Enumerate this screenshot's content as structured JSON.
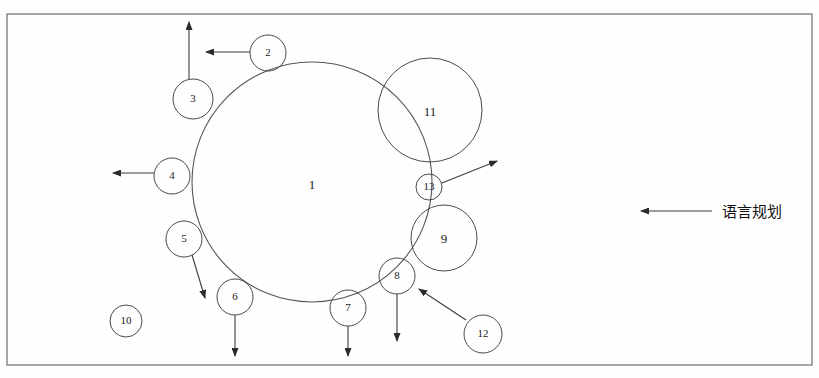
{
  "figure": {
    "type": "concentric-satellite-circle-diagram",
    "background_color": "#fefefe",
    "stroke_color": "#4a4a4a",
    "text_color": "#1b1b1b"
  },
  "frame": {
    "x": 7,
    "y": 14,
    "width": 805,
    "height": 351
  },
  "nodes": {
    "center": {
      "label": "1",
      "cx": 312,
      "cy": 182,
      "r": 120,
      "label_x": 312,
      "label_y": 186
    },
    "large": [
      {
        "label": "11",
        "cx": 430,
        "cy": 110,
        "r": 52,
        "label_x": 430,
        "label_y": 113
      },
      {
        "label": "9",
        "cx": 444,
        "cy": 238,
        "r": 33,
        "label_x": 444,
        "label_y": 240
      }
    ],
    "satellites": [
      {
        "label": "2",
        "cx": 268,
        "cy": 53,
        "r": 18
      },
      {
        "label": "3",
        "cx": 193,
        "cy": 99,
        "r": 20
      },
      {
        "label": "4",
        "cx": 172,
        "cy": 176,
        "r": 18
      },
      {
        "label": "5",
        "cx": 184,
        "cy": 239,
        "r": 18
      },
      {
        "label": "6",
        "cx": 235,
        "cy": 297,
        "r": 18
      },
      {
        "label": "7",
        "cx": 348,
        "cy": 308,
        "r": 18
      },
      {
        "label": "8",
        "cx": 397,
        "cy": 276,
        "r": 18
      },
      {
        "label": "10",
        "cx": 126,
        "cy": 321,
        "r": 16
      },
      {
        "label": "12",
        "cx": 483,
        "cy": 334,
        "r": 19
      },
      {
        "label": "13",
        "cx": 429,
        "cy": 187,
        "r": 13
      }
    ]
  },
  "arrows": [
    {
      "name": "arrow-from-2-left",
      "from": "2",
      "x1": 250,
      "y1": 52,
      "x2": 206,
      "y2": 52
    },
    {
      "name": "arrow-from-3-up",
      "from": "3",
      "x1": 189,
      "y1": 79,
      "x2": 189,
      "y2": 22
    },
    {
      "name": "arrow-from-4-left",
      "from": "4",
      "x1": 154,
      "y1": 173,
      "x2": 113,
      "y2": 173
    },
    {
      "name": "arrow-from-5-downright",
      "from": "5",
      "x1": 192,
      "y1": 255,
      "x2": 205,
      "y2": 298
    },
    {
      "name": "arrow-from-6-down",
      "from": "6",
      "x1": 235,
      "y1": 315,
      "x2": 235,
      "y2": 356
    },
    {
      "name": "arrow-from-7-down",
      "from": "7",
      "x1": 348,
      "y1": 326,
      "x2": 348,
      "y2": 356
    },
    {
      "name": "arrow-from-8-down",
      "from": "8",
      "x1": 397,
      "y1": 294,
      "x2": 397,
      "y2": 341
    },
    {
      "name": "arrow-from-12-to-8",
      "from": "12",
      "x1": 466,
      "y1": 320,
      "x2": 419,
      "y2": 289
    },
    {
      "name": "arrow-from-13-upright",
      "from": "13",
      "x1": 442,
      "y1": 183,
      "x2": 497,
      "y2": 161
    }
  ],
  "legend": {
    "label": "语言规划",
    "arrow": {
      "x1": 712,
      "y1": 211,
      "x2": 641,
      "y2": 211
    },
    "text_x": 722,
    "text_y": 212,
    "direction": "left"
  }
}
